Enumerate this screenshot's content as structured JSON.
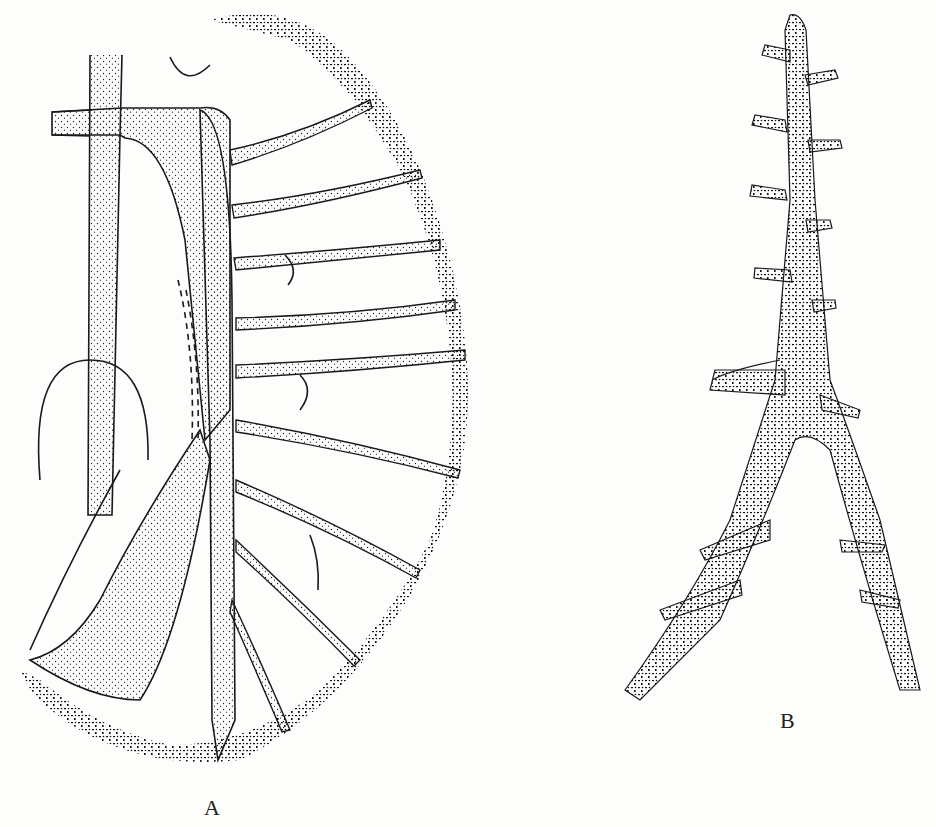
{
  "figure": {
    "panels": [
      {
        "id": "A",
        "label": "A",
        "description": "branching stippled vascular/gill structure with lobed stippled margin"
      },
      {
        "id": "B",
        "label": "B",
        "description": "tree-like stippled branching structure forking at base"
      }
    ],
    "colors": {
      "ink": "#1a1a1a",
      "paper": "#fdfdfc"
    }
  }
}
